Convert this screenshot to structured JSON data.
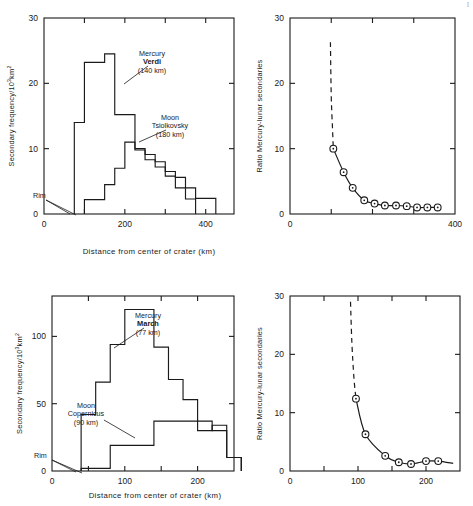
{
  "figure": {
    "background": "#ffffff",
    "ink": "#1a1a1a",
    "xaxis_caption": "Distance from center of crater (km)",
    "top_right_corner_mark": "["
  },
  "chart_data": [
    {
      "id": "panel-a",
      "position": "top-left",
      "type": "line",
      "subtype": "step-histogram",
      "title": "",
      "xlabel": "Distance from center of crater (km)",
      "ylabel": "Secondary frequency/10³km²",
      "ylabel_base": "Secondary frequency/10",
      "ylabel_exp": "3",
      "ylabel_tail": "km",
      "ylabel_tail_exp": "2",
      "xlim": [
        0,
        470
      ],
      "ylim": [
        0,
        30
      ],
      "xticks": [
        0,
        200,
        400
      ],
      "xticklabels": [
        "0",
        "200",
        "400"
      ],
      "xticks_minor": [
        100,
        300
      ],
      "yticks": [
        0,
        10,
        20,
        30
      ],
      "yticklabels": [
        "0",
        "10",
        "20",
        "30"
      ],
      "grid": false,
      "legend": "annotations",
      "annotations": [
        {
          "name": "mercury-verdi",
          "lines": [
            "Mercury",
            "Verdi",
            "(140 km)"
          ],
          "bold_line": 1,
          "x": 152,
          "y": 56
        },
        {
          "name": "moon-tsiolkovsky",
          "lines": [
            "Moon",
            "Tsiolkovsky",
            "(180 km)"
          ],
          "bold_line": -1,
          "x": 170,
          "y": 120
        },
        {
          "name": "rim",
          "lines": [
            "Rim"
          ],
          "bold_line": -1,
          "x": 33,
          "y": 198
        }
      ],
      "series": [
        {
          "name": "Mercury Verdi (140 km)",
          "bin_width": 25,
          "bin_starts": [
            75,
            100,
            125,
            150,
            175,
            200,
            225,
            250,
            275,
            300,
            325,
            350,
            375,
            400
          ],
          "values": [
            14.0,
            23.2,
            23.2,
            24.5,
            15.2,
            15.2,
            9.8,
            9.1,
            8.0,
            6.5,
            5.6,
            4.0,
            2.4,
            2.4
          ]
        },
        {
          "name": "Moon Tsiolkovsky (180 km)",
          "bin_width": 25,
          "bin_starts": [
            100,
            125,
            150,
            175,
            200,
            225,
            250,
            275,
            300,
            325,
            350
          ],
          "values": [
            2.2,
            2.2,
            4.5,
            7.0,
            11.0,
            10.0,
            8.3,
            7.2,
            5.8,
            4.0,
            2.3
          ]
        }
      ]
    },
    {
      "id": "panel-b",
      "position": "top-right",
      "type": "line",
      "subtype": "scatter-with-curve",
      "title": "",
      "xlabel": "Distance from center of crater (km)",
      "ylabel": "Ratio Mercury-lunar secondaries",
      "xlim": [
        0,
        400
      ],
      "ylim": [
        0,
        30
      ],
      "xticks": [
        0,
        400
      ],
      "xticklabels": [
        "0",
        "400"
      ],
      "xticks_minor": [
        100,
        200,
        300
      ],
      "yticks": [
        0,
        10,
        20,
        30
      ],
      "yticklabels": [
        "0",
        "10",
        "20",
        "30"
      ],
      "grid": false,
      "dashed_head": {
        "x": [
          98,
          100,
          103
        ],
        "y": [
          26.3,
          18.0,
          13.2
        ]
      },
      "points": {
        "x": [
          105,
          130,
          152,
          180,
          205,
          230,
          257,
          283,
          308,
          333,
          358
        ],
        "y": [
          10.0,
          6.4,
          4.0,
          2.1,
          1.6,
          1.3,
          1.3,
          1.2,
          1.0,
          1.0,
          1.0
        ]
      }
    },
    {
      "id": "panel-c",
      "position": "bottom-left",
      "type": "line",
      "subtype": "step-histogram",
      "title": "",
      "xlabel": "Distance from center of crater (km)",
      "ylabel": "Secondary frequency/10³km²",
      "ylabel_base": "Secondary frequency/10",
      "ylabel_exp": "3",
      "ylabel_tail": "km",
      "ylabel_tail_exp": "2",
      "xlim": [
        0,
        250
      ],
      "ylim": [
        0,
        130
      ],
      "xticks": [
        0,
        100,
        200
      ],
      "xticklabels": [
        "0",
        "100",
        "200"
      ],
      "xticks_minor": [
        50,
        150
      ],
      "yticks": [
        0,
        50,
        100
      ],
      "yticklabels": [
        "0",
        "50",
        "100"
      ],
      "grid": false,
      "legend": "annotations",
      "annotations": [
        {
          "name": "mercury-march",
          "lines": [
            "Mercury",
            "March",
            "(77 km)"
          ],
          "bold_line": 1,
          "x": 148,
          "y": 56
        },
        {
          "name": "moon-copernicus",
          "lines": [
            "Moon",
            "Copernicus",
            "(90 km)"
          ],
          "bold_line": -1,
          "x": 86,
          "y": 146
        },
        {
          "name": "rim",
          "lines": [
            "Rim"
          ],
          "bold_line": -1,
          "x": 34,
          "y": 196
        }
      ],
      "series": [
        {
          "name": "Mercury March (77 km)",
          "bin_width": 20,
          "bin_starts": [
            40,
            60,
            80,
            100,
            120,
            140,
            160,
            180,
            200,
            220,
            240
          ],
          "values": [
            42,
            66,
            94,
            120,
            120,
            92,
            68,
            53,
            37,
            30,
            10
          ]
        },
        {
          "name": "Moon Copernicus (90 km)",
          "bin_width": 20,
          "bin_starts": [
            40,
            60,
            80,
            100,
            120,
            140,
            160,
            180,
            200,
            220,
            240
          ],
          "values": [
            2,
            2,
            19,
            19,
            19,
            37,
            37,
            37,
            30,
            34,
            10
          ]
        }
      ]
    },
    {
      "id": "panel-d",
      "position": "bottom-right",
      "type": "line",
      "subtype": "scatter-with-curve",
      "title": "",
      "xlabel": "Distance from center of crater (km)",
      "ylabel": "Ratio Mercury-lunar secondaries",
      "xlim": [
        0,
        250
      ],
      "ylim": [
        0,
        30
      ],
      "xticks": [
        0,
        100,
        200
      ],
      "xticklabels": [
        "0",
        "100",
        "200"
      ],
      "xticks_minor": [
        50,
        150
      ],
      "yticks": [
        0,
        10,
        20,
        30
      ],
      "yticklabels": [
        "0",
        "10",
        "20",
        "30"
      ],
      "grid": false,
      "dashed_head": {
        "x": [
          89,
          91,
          94
        ],
        "y": [
          29.0,
          22.0,
          16.0
        ]
      },
      "points": {
        "x": [
          97,
          111,
          140,
          160,
          178,
          200,
          218
        ],
        "y": [
          12.4,
          6.3,
          2.6,
          1.5,
          1.2,
          1.7,
          1.7
        ]
      }
    }
  ]
}
